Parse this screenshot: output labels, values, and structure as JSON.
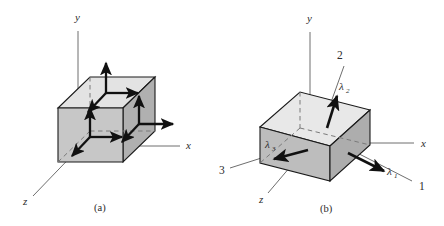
{
  "figure": {
    "background_color": "#ffffff",
    "ink_color": "#2b2b2b",
    "face_colors": {
      "top": "#e3e3e3",
      "front": "#c9c9c9",
      "right": "#b3b3b3",
      "left": "#bdbdbd",
      "outline": "#1a1a1a",
      "axis_line": "#6e6e6e",
      "dashed_line": "#7a7a7a",
      "arrow": "#111111"
    }
  },
  "panels": [
    {
      "id": "panel-a",
      "caption": "(a)",
      "caption_pos": {
        "x": 100,
        "y": 209
      },
      "axes": [
        {
          "name": "y-axis",
          "label": "y",
          "label_pos": {
            "x": 75,
            "y": 21
          }
        },
        {
          "name": "x-axis",
          "label": "x",
          "label_pos": {
            "x": 186,
            "y": 147
          }
        },
        {
          "name": "z-axis",
          "label": "z",
          "label_pos": {
            "x": 23,
            "y": 203
          }
        }
      ],
      "arrows": [
        {
          "name": "top-face-normal-arrow",
          "direction": "up"
        },
        {
          "name": "top-face-shear-arrow-x",
          "direction": "right"
        },
        {
          "name": "top-face-shear-arrow-z",
          "direction": "down-left"
        },
        {
          "name": "front-face-normal-arrow",
          "direction": "up"
        },
        {
          "name": "front-face-shear-arrow-x",
          "direction": "right"
        },
        {
          "name": "front-face-shear-arrow-z",
          "direction": "down-left"
        },
        {
          "name": "right-face-normal-arrow",
          "direction": "right"
        },
        {
          "name": "right-face-shear-arrow-y",
          "direction": "up"
        },
        {
          "name": "right-face-shear-arrow-z",
          "direction": "down-left"
        }
      ]
    },
    {
      "id": "panel-b",
      "caption": "(b)",
      "caption_pos": {
        "x": 326,
        "y": 210
      },
      "axes": [
        {
          "name": "y-axis",
          "label": "y",
          "label_pos": {
            "x": 307,
            "y": 22
          }
        },
        {
          "name": "x-axis",
          "label": "x",
          "label_pos": {
            "x": 421,
            "y": 145
          }
        },
        {
          "name": "z-axis",
          "label": "z",
          "label_pos": {
            "x": 259,
            "y": 201
          }
        }
      ],
      "principal_axes": [
        {
          "name": "principal-axis-1",
          "label": "1",
          "label_pos": {
            "x": 419,
            "y": 189
          }
        },
        {
          "name": "principal-axis-2",
          "label": "2",
          "label_pos": {
            "x": 338,
            "y": 58
          }
        },
        {
          "name": "principal-axis-3",
          "label": "3",
          "label_pos": {
            "x": 220,
            "y": 173
          }
        }
      ],
      "principal_stresses": [
        {
          "name": "lambda-1",
          "symbol": "λ",
          "subscript": "1",
          "label_pos": {
            "x": 387,
            "y": 172
          }
        },
        {
          "name": "lambda-2",
          "symbol": "λ",
          "subscript": "2",
          "label_pos": {
            "x": 340,
            "y": 88
          }
        },
        {
          "name": "lambda-3",
          "symbol": "λ",
          "subscript": "3",
          "label_pos": {
            "x": 267,
            "y": 146
          }
        }
      ]
    }
  ]
}
